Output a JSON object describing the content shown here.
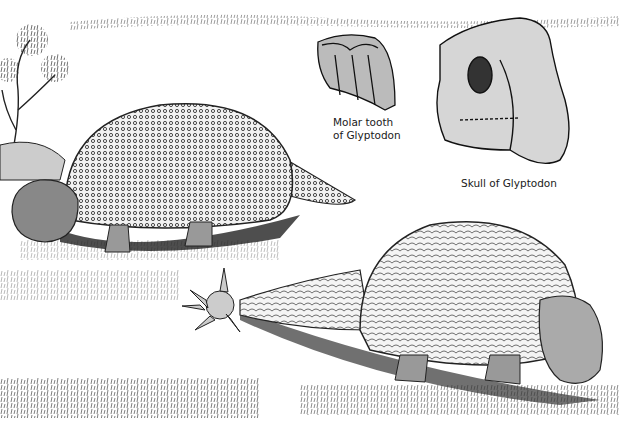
{
  "illustration": {
    "subject": "Glyptodon illustration",
    "background_color": "#ffffff",
    "ink_color": "#1a1a1a"
  },
  "labels": {
    "tooth_line1": "Molar tooth",
    "tooth_line2": "of Glyptodon",
    "skull": "Skull of Glyptodon"
  }
}
